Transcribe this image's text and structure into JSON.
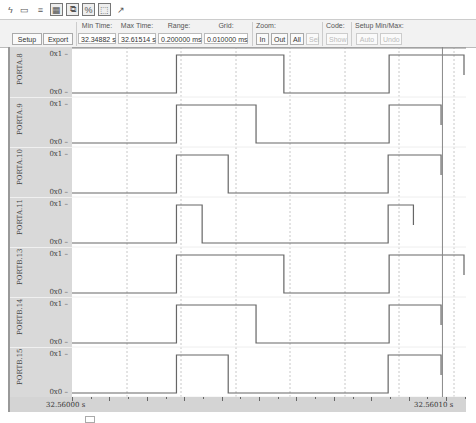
{
  "toolbar": {
    "icons": [
      "lightning-icon",
      "window-icon",
      "list-icon",
      "grid-icon",
      "layers-icon",
      "link-icon",
      "capture-icon",
      "pin-icon"
    ]
  },
  "panel": {
    "setup_label": "Setup",
    "export_label": "Export",
    "min_time_label": "Min Time:",
    "min_time_value": "32.34882 s",
    "max_time_label": "Max Time:",
    "max_time_value": "32.61514 s",
    "range_label": "Range:",
    "range_value": "0.200000 ms",
    "grid_label": "Grid:",
    "grid_value": "0.010000 ms",
    "zoom_label": "Zoom:",
    "zoom_in": "In",
    "zoom_out": "Out",
    "zoom_all": "All",
    "zoom_sel": "Sel",
    "code_label": "Code:",
    "show_label": "Show",
    "setup_minmax_label": "Setup Min/Max:",
    "auto_label": "Auto",
    "undo_label": "Undo"
  },
  "signals": [
    {
      "name": "PORTA.8",
      "high": "0x1",
      "low": "0x0",
      "transitions": [
        0,
        0.2665,
        0.5405,
        0.809,
        1.0
      ],
      "start": 0
    },
    {
      "name": "PORTA.9",
      "high": "0x1",
      "low": "0x0",
      "transitions": [
        0,
        0.2665,
        0.4695,
        0.809,
        0.9415
      ],
      "start": 0
    },
    {
      "name": "PORTA.10",
      "high": "0x1",
      "low": "0x0",
      "transitions": [
        0,
        0.2665,
        0.3985,
        0.8065,
        0.9415
      ],
      "start": 0
    },
    {
      "name": "PORTA.11",
      "high": "0x1",
      "low": "0x0",
      "transitions": [
        0,
        0.2665,
        0.332,
        0.8065,
        0.871
      ],
      "start": 0
    },
    {
      "name": "PORTB.13",
      "high": "0x1",
      "low": "0x0",
      "transitions": [
        0,
        0.2665,
        0.5405,
        0.809,
        1.0
      ],
      "start": 0
    },
    {
      "name": "PORTB.14",
      "high": "0x1",
      "low": "0x0",
      "transitions": [
        0,
        0.2665,
        0.4695,
        0.809,
        0.9415
      ],
      "start": 0
    },
    {
      "name": "PORTB.15",
      "high": "0x1",
      "low": "0x0",
      "transitions": [
        0,
        0.2665,
        0.3985,
        0.8065,
        0.9415
      ],
      "start": 0
    }
  ],
  "axis": {
    "start_label": "32.56000  s",
    "end_label": "32.56010  s"
  },
  "cursor_fraction": 0.945
}
